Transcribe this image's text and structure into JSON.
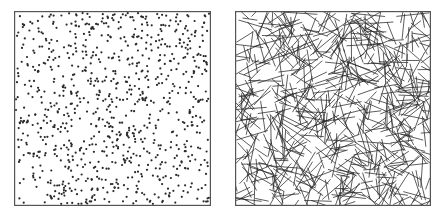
{
  "figure": {
    "panels": [
      {
        "id": "left",
        "kind": "point-pattern",
        "description": "random points in unit square",
        "box": {
          "x": 14,
          "y": 11,
          "width": 197,
          "height": 195
        },
        "count": 900,
        "dot_radius": 1.1,
        "color": "#2a2a2a",
        "seed": 12345
      },
      {
        "id": "right",
        "kind": "segment-pattern",
        "description": "random line segments in unit square",
        "box": {
          "x": 235,
          "y": 11,
          "width": 196,
          "height": 195
        },
        "count": 650,
        "segment_length_min": 12,
        "segment_length_max": 36,
        "stroke_width": 0.9,
        "color": "#2a2a2a",
        "seed": 67890
      }
    ],
    "frame_color": "#555555",
    "background": "#ffffff"
  }
}
